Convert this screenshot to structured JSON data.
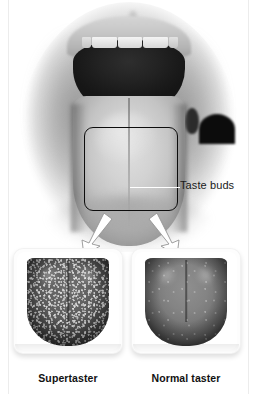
{
  "figure": {
    "background_color": "#ffffff",
    "width": 266,
    "height": 394
  },
  "main_photo": {
    "name": "open-mouth-photograph",
    "description": "Grayscale photograph of an open mouth showing upper teeth, dark oral cavity and the tongue",
    "callout_box": {
      "name": "tongue-region-callout",
      "shape": "rounded-rectangle",
      "stroke_color": "#0d0d0d"
    }
  },
  "annotation": {
    "leader_line_color": "#ffffff",
    "label": "Taste buds"
  },
  "arrows": {
    "color": "#ffffff",
    "outline_color": "#8c8c8c",
    "count": 2,
    "left_arrow_name": "arrow-to-supertaster",
    "right_arrow_name": "arrow-to-normal-taster"
  },
  "panels": [
    {
      "id": "supertaster",
      "caption": "Supertaster",
      "swatch_description": "Close-up of tongue surface densely covered with many small fungiform papillae (taste buds)",
      "papillae_density": "dense",
      "tone": "#555555"
    },
    {
      "id": "normal-taster",
      "caption": "Normal taster",
      "swatch_description": "Close-up of tongue surface with far fewer, more widely spaced fungiform papillae",
      "papillae_density": "sparse",
      "tone": "#767676"
    }
  ]
}
